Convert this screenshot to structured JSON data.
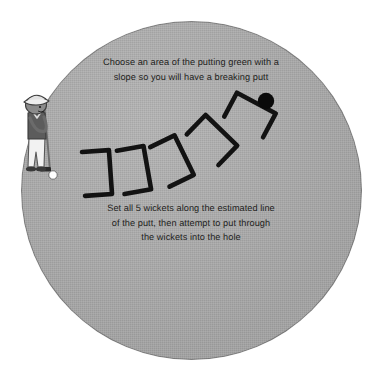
{
  "scene": {
    "title": "Putting green wicket drill",
    "background_color": "#ffffff",
    "green_color": "#acacac",
    "ink_color": "#121212"
  },
  "captions": {
    "top": "Choose an area of the putting green with a\nslope so you will have a breaking putt",
    "bottom": "Set all 5 wickets along the estimated line\nof the putt, then attempt to put through\nthe wickets into the hole"
  },
  "diagram": {
    "wicket_count": 5,
    "wicket_label": "wicket",
    "hole_label": "hole",
    "ball_label": "golf ball",
    "golfer_label": "golfer putting",
    "wickets": [
      {
        "name": "wicket-1",
        "cx": 97,
        "cy": 173,
        "rotation": -4
      },
      {
        "name": "wicket-2",
        "cx": 134,
        "cy": 170,
        "rotation": -10
      },
      {
        "name": "wicket-3",
        "cx": 172,
        "cy": 161,
        "rotation": -26
      },
      {
        "name": "wicket-4",
        "cx": 212,
        "cy": 140,
        "rotation": -46
      },
      {
        "name": "wicket-5",
        "cx": 250,
        "cy": 115,
        "rotation": -62
      }
    ],
    "hole": {
      "cx": 266,
      "cy": 101,
      "r": 8.2
    },
    "ball": {
      "cx": 53,
      "cy": 175,
      "r": 4.2
    }
  }
}
